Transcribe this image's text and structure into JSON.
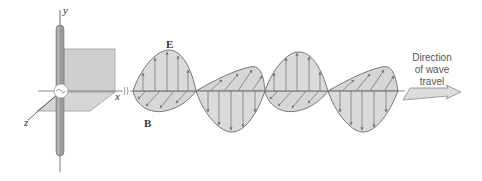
{
  "axes": {
    "x_label": "x",
    "y_label": "y",
    "z_label": "z"
  },
  "vectors": {
    "electric_field": "E",
    "magnetic_field": "B",
    "vector_arrow": "→"
  },
  "caption": {
    "line1": "Direction",
    "line2": "of wave",
    "line3": "travel"
  },
  "source_symbol": "~",
  "colors": {
    "fill": "#d4d4d4",
    "stroke": "#777777",
    "rod": "#9a9a9a",
    "plane": "#cfcfcf",
    "text": "#333333"
  }
}
